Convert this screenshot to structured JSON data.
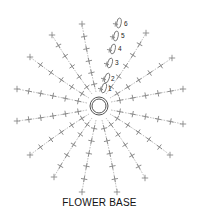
{
  "caption": "FLOWER BASE",
  "colors": {
    "stitch": "#8a8a8a",
    "ring": "#555555",
    "text": "#111111",
    "background": "#ffffff"
  },
  "center": {
    "x": 99,
    "y": 106,
    "r_outer": 9,
    "r_inner": 7
  },
  "spokes": [
    {
      "name": "spoke-top-left-1",
      "from": [
        96,
        92
      ],
      "ctrl": [
        88,
        60
      ],
      "to": [
        82,
        24
      ],
      "stitches": 6
    },
    {
      "name": "spoke-top-left-2",
      "from": [
        92,
        94
      ],
      "ctrl": [
        70,
        65
      ],
      "to": [
        52,
        35
      ],
      "stitches": 6
    },
    {
      "name": "spoke-left-upper-1",
      "from": [
        89,
        98
      ],
      "ctrl": [
        60,
        80
      ],
      "to": [
        30,
        57
      ],
      "stitches": 6
    },
    {
      "name": "spoke-left-upper-2",
      "from": [
        87,
        103
      ],
      "ctrl": [
        50,
        95
      ],
      "to": [
        17,
        89
      ],
      "stitches": 6
    },
    {
      "name": "spoke-left-lower-1",
      "from": [
        87,
        110
      ],
      "ctrl": [
        50,
        117
      ],
      "to": [
        17,
        121
      ],
      "stitches": 6
    },
    {
      "name": "spoke-left-lower-2",
      "from": [
        89,
        114
      ],
      "ctrl": [
        60,
        132
      ],
      "to": [
        30,
        155
      ],
      "stitches": 6
    },
    {
      "name": "spoke-bottom-left-1",
      "from": [
        92,
        118
      ],
      "ctrl": [
        72,
        145
      ],
      "to": [
        54,
        177
      ],
      "stitches": 6
    },
    {
      "name": "spoke-bottom-left-2",
      "from": [
        96,
        120
      ],
      "ctrl": [
        88,
        155
      ],
      "to": [
        82,
        192
      ],
      "stitches": 6
    },
    {
      "name": "spoke-bottom-right-1",
      "from": [
        102,
        120
      ],
      "ctrl": [
        111,
        155
      ],
      "to": [
        117,
        192
      ],
      "stitches": 6
    },
    {
      "name": "spoke-bottom-right-2",
      "from": [
        106,
        118
      ],
      "ctrl": [
        127,
        145
      ],
      "to": [
        145,
        178
      ],
      "stitches": 6
    },
    {
      "name": "spoke-right-lower-1",
      "from": [
        110,
        114
      ],
      "ctrl": [
        140,
        132
      ],
      "to": [
        170,
        155
      ],
      "stitches": 6
    },
    {
      "name": "spoke-right-lower-2",
      "from": [
        111,
        110
      ],
      "ctrl": [
        148,
        117
      ],
      "to": [
        183,
        124
      ],
      "stitches": 6
    },
    {
      "name": "spoke-right-upper-1",
      "from": [
        111,
        102
      ],
      "ctrl": [
        148,
        95
      ],
      "to": [
        183,
        89
      ],
      "stitches": 6
    },
    {
      "name": "spoke-right-upper-2",
      "from": [
        110,
        98
      ],
      "ctrl": [
        140,
        80
      ],
      "to": [
        172,
        58
      ],
      "stitches": 6
    },
    {
      "name": "spoke-top-right-1",
      "from": [
        106,
        94
      ],
      "ctrl": [
        128,
        65
      ],
      "to": [
        146,
        33
      ],
      "stitches": 6
    }
  ],
  "chain": {
    "labels": [
      "1",
      "2",
      "3",
      "4",
      "5",
      "6"
    ],
    "ovals": [
      {
        "cx": 104,
        "cy": 88,
        "rx": 2.2,
        "ry": 5,
        "rot": 15
      },
      {
        "cx": 107,
        "cy": 78,
        "rx": 2.2,
        "ry": 5,
        "rot": 18
      },
      {
        "cx": 110,
        "cy": 63,
        "rx": 2.2,
        "ry": 5,
        "rot": 15
      },
      {
        "cx": 113,
        "cy": 49,
        "rx": 2.2,
        "ry": 5,
        "rot": 12
      },
      {
        "cx": 116,
        "cy": 36,
        "rx": 2.2,
        "ry": 5,
        "rot": 10
      },
      {
        "cx": 119,
        "cy": 23,
        "rx": 2.2,
        "ry": 5,
        "rot": 8
      }
    ],
    "label_positions": [
      [
        108,
        91
      ],
      [
        111,
        81
      ],
      [
        115,
        65
      ],
      [
        118,
        51
      ],
      [
        121,
        38
      ],
      [
        124,
        26
      ]
    ]
  }
}
